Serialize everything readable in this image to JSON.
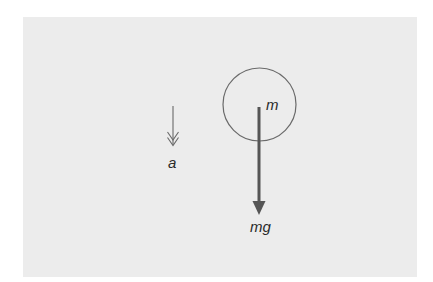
{
  "diagram": {
    "type": "free-body diagram",
    "body": {
      "shape": "circle",
      "label": "m"
    },
    "forces": [
      {
        "name": "weight",
        "label": "mg",
        "direction": "down",
        "style": "thick arrow with filled head"
      }
    ],
    "acceleration": {
      "label": "a",
      "direction": "down",
      "style": "thin arrow with double open head"
    }
  },
  "colors": {
    "outer_background": "#ffffff",
    "panel_background": "#ececec",
    "stroke": "#555555",
    "text": "#2a2a2a"
  }
}
